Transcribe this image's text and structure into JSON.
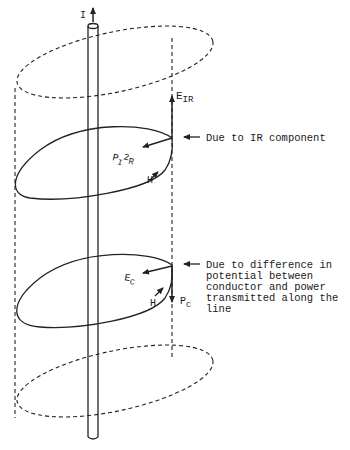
{
  "diagram": {
    "labels": {
      "current": "I",
      "e_ir_main": "E",
      "e_ir_sub": "IR",
      "p_i2r_main": "P",
      "p_i2r_sub": "I",
      "p_i2r_sup": "2",
      "p_i2r_tail": "R",
      "h_upper": "H",
      "e_c_main": "E",
      "e_c_sub": "C",
      "h_lower": "H",
      "p_c_main": "P",
      "p_c_sub": "C"
    },
    "annotations": {
      "upper": "Due to IR component",
      "lower": [
        "Due to difference in",
        "potential between",
        "conductor and power",
        "transmitted along the",
        "line"
      ]
    }
  }
}
